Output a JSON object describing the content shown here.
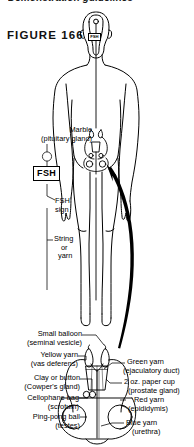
{
  "page": {
    "clipped_header": "Demonstration guidelines",
    "figure_label": "FIGURE 166"
  },
  "diagram": {
    "fsh_sign_box": "FSH",
    "head_fsh_box": "FSH"
  },
  "labels": {
    "left": [
      {
        "id": "marble",
        "line1": "Marble",
        "line2": "(pituitary gland)"
      },
      {
        "id": "fsh-sign",
        "line1": "FSH",
        "line2": "sign"
      },
      {
        "id": "string",
        "line1": "String",
        "line2": "or",
        "line3": "yarn"
      },
      {
        "id": "small-balloon",
        "line1": "Small balloon",
        "line2": "(seminal vesicle)"
      },
      {
        "id": "yellow-yarn",
        "line1": "Yellow yarn",
        "line2": "(vas deferens)"
      },
      {
        "id": "clay-button",
        "line1": "Clay or button",
        "line2": "(Cowper's gland)"
      },
      {
        "id": "cellophane-bag",
        "line1": "Cellophane bag",
        "line2": "(scrotum)"
      },
      {
        "id": "ping-pong-ball",
        "line1": "Ping-pong ball",
        "line2": "(testes)"
      }
    ],
    "right": [
      {
        "id": "green-yarn",
        "line1": "Green yarn",
        "line2": "(ejaculatory duct)"
      },
      {
        "id": "paper-cup",
        "line1": "2 oz. paper cup",
        "line2": "(prostate gland)"
      },
      {
        "id": "red-yarn",
        "line1": "Red yarn",
        "line2": "(epididymis)"
      },
      {
        "id": "blue-yarn",
        "line1": "Blue yarn",
        "line2": "(urethra)"
      }
    ]
  },
  "colors": {
    "ink": "#000000",
    "paper": "#ffffff"
  }
}
